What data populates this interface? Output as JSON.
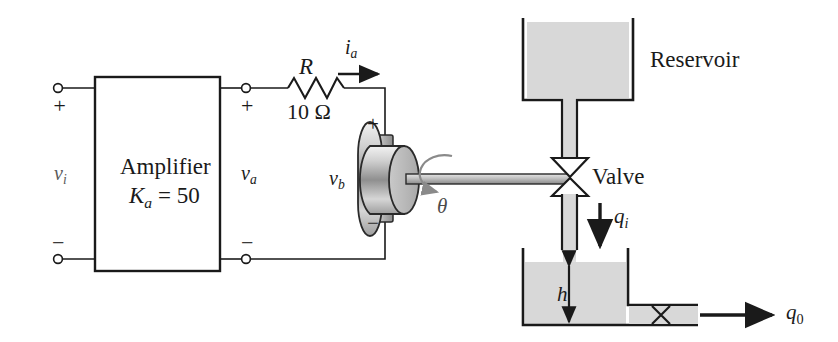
{
  "figure": {
    "type": "schematic-diagram",
    "background_color": "#ffffff",
    "line_color": "#1a1a1a",
    "fluid_color": "#d8d8d8",
    "metal_color": "#b3b3b3"
  },
  "electrical": {
    "amplifier": {
      "name_label": "Amplifier",
      "gain_label": "K",
      "gain_sub": "a",
      "gain_value": " = 50"
    },
    "input": {
      "plus": "+",
      "minus": "−",
      "voltage_label": "v",
      "voltage_sub": "i"
    },
    "output": {
      "plus": "+",
      "minus": "−",
      "voltage_label": "v",
      "voltage_sub": "a"
    },
    "resistor": {
      "symbol_label": "R",
      "value_label": "10 Ω"
    },
    "current": {
      "label": "i",
      "sub": "a"
    },
    "motor": {
      "back_emf_label": "v",
      "back_emf_sub": "b",
      "terminal_plus": "+",
      "terminal_minus": "−",
      "shaft_angle_label": "θ"
    }
  },
  "hydraulic": {
    "reservoir": {
      "label": "Reservoir"
    },
    "valve": {
      "label": "Valve"
    },
    "inflow": {
      "label": "q",
      "sub": "i"
    },
    "tank": {
      "height_label": "h"
    },
    "outflow": {
      "label": "q",
      "sub": "0"
    }
  }
}
